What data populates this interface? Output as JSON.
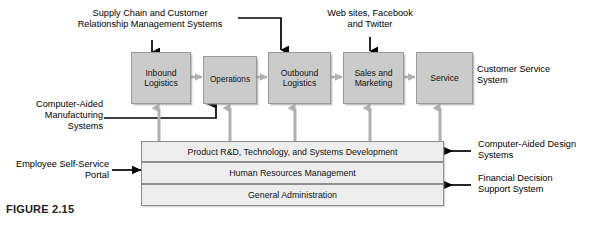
{
  "figure": {
    "caption": "FIGURE 2.15"
  },
  "value_chain": {
    "primary_activities": [
      {
        "id": "inbound-logistics",
        "label": "Inbound\nLogistics"
      },
      {
        "id": "operations",
        "label": "Operations"
      },
      {
        "id": "outbound-logistics",
        "label": "Outbound\nLogistics"
      },
      {
        "id": "sales-and-marketing",
        "label": "Sales and\nMarketing"
      },
      {
        "id": "service",
        "label": "Service"
      }
    ],
    "support_activities": [
      {
        "id": "product-rd",
        "label": "Product R&D, Technology, and Systems Development"
      },
      {
        "id": "human-resources",
        "label": "Human Resources Management"
      },
      {
        "id": "general-administration",
        "label": "General Administration"
      }
    ]
  },
  "annotations": {
    "supply_chain_crm": "Supply Chain and Customer\nRelationship Management Systems",
    "web_social": "Web sites, Facebook\nand Twitter",
    "customer_service": "Customer Service\nSystem",
    "computer_aided_manufacturing": "Computer-Aided\nManufacturing\nSystems",
    "employee_self_service": "Employee Self-Service\nPortal",
    "computer_aided_design": "Computer-Aided Design\nSystems",
    "financial_decision_support": "Financial Decision\nSupport System"
  },
  "colors": {
    "activity_box_fill": "#cbcbcb",
    "activity_box_border": "#9a9a9a",
    "support_bar_fill": "#ededed",
    "support_bar_border": "#8e8e8e",
    "gray_arrow": "#b0b0b0",
    "black_arrow": "#000000",
    "page_background": "#ffffff"
  }
}
